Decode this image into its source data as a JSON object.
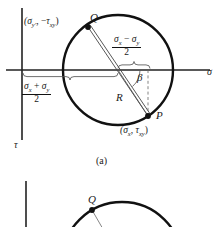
{
  "figure": {
    "caption_a": "(a)",
    "axis_sigma": "σ",
    "axis_tau": "τ",
    "point_q": "Q",
    "point_p": "P",
    "label_r": "R",
    "label_beta": "β",
    "q_coord_open": "(",
    "q_coord_sigma": "σ",
    "q_coord_sigma_sub": "y′",
    "q_coord_sep": ", −",
    "q_coord_tau": "τ",
    "q_coord_tau_sub": "xy",
    "q_coord_close": ")",
    "p_coord_open": "(",
    "p_coord_sigma": "σ",
    "p_coord_sigma_sub": "x",
    "p_coord_sep": ", ",
    "p_coord_tau": "τ",
    "p_coord_tau_sub": "xy",
    "p_coord_close": ")",
    "frac_diff_num_a": "σ",
    "frac_diff_num_a_sub": "x",
    "frac_diff_op": " − ",
    "frac_diff_num_b": "σ",
    "frac_diff_num_b_sub": "y",
    "frac_diff_den": "2",
    "frac_sum_num_a": "σ",
    "frac_sum_num_a_sub": "x",
    "frac_sum_op": " + ",
    "frac_sum_num_b": "σ",
    "frac_sum_num_b_sub": "y",
    "frac_sum_den": "2"
  },
  "figure_b": {
    "point_q": "Q"
  },
  "colors": {
    "stroke": "#111111",
    "thin": "#555555",
    "background": "#ffffff"
  },
  "geometry": {
    "circle_center_x": 118,
    "circle_center_y": 70,
    "circle_radius": 55,
    "axis_h_y": 70,
    "axis_v_x": 22,
    "point_p_x": 148,
    "point_p_y": 116,
    "point_q_x": 88,
    "point_q_y": 27
  }
}
